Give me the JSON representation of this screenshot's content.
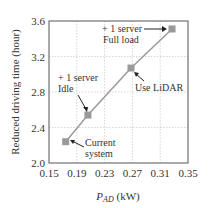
{
  "chart_data": {
    "type": "line",
    "title": "",
    "xlabel": "P_AD (kW)",
    "xlabel_main": "P",
    "xlabel_sub": "AD",
    "xlabel_unit": " (kW)",
    "ylabel": "Reduced driving time (hour)",
    "xlim": [
      0.15,
      0.35
    ],
    "ylim": [
      2.0,
      3.6
    ],
    "xticks": [
      "0.15",
      "0.19",
      "0.23",
      "0.27",
      "0.31",
      "0.35"
    ],
    "yticks": [
      "2.0",
      "2.4",
      "2.8",
      "3.2",
      "3.6"
    ],
    "grid": true,
    "series": [
      {
        "name": "configurations",
        "color": "#9a9a9a",
        "marker": "square",
        "x": [
          0.174,
          0.206,
          0.268,
          0.327
        ],
        "y": [
          2.24,
          2.54,
          3.07,
          3.51
        ]
      }
    ],
    "annotations": [
      {
        "lines": [
          "Current",
          "system"
        ],
        "point_index": 0
      },
      {
        "lines": [
          "+ 1 server",
          "Idle"
        ],
        "point_index": 1
      },
      {
        "lines": [
          "Use LiDAR"
        ],
        "point_index": 2
      },
      {
        "lines": [
          "+ 1 server",
          "Full load"
        ],
        "point_index": 3
      }
    ]
  }
}
